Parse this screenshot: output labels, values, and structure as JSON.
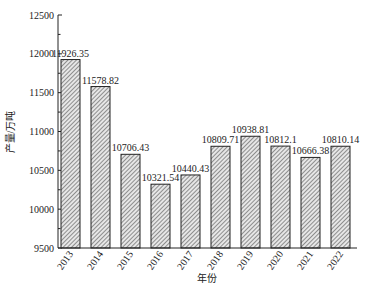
{
  "chart_data": {
    "type": "bar",
    "title": "",
    "xlabel": "年份",
    "ylabel": "产量/万吨",
    "categories": [
      "2013",
      "2014",
      "2015",
      "2016",
      "2017",
      "2018",
      "2019",
      "2020",
      "2021",
      "2022"
    ],
    "values": [
      11926.35,
      11578.82,
      10706.43,
      10321.54,
      10440.43,
      10809.71,
      10938.81,
      10812.1,
      10666.38,
      10810.14
    ],
    "value_labels": [
      "11926.35",
      "11578.82",
      "10706.43",
      "10321.54",
      "10440.43",
      "10809.71",
      "10938.81",
      "10812.1",
      "10666.38",
      "10810.14"
    ],
    "ylim": [
      9500,
      12500
    ],
    "yticks": [
      9500,
      10000,
      10500,
      11000,
      11500,
      12000,
      12500
    ],
    "minor_ytick_step": 250,
    "grid": false,
    "legend": null,
    "bar_fill": "diagonal-hatch",
    "colors": {
      "bar_edge": "#222222",
      "hatch": "#444444",
      "bar_bg": "#e8e8e8"
    }
  }
}
